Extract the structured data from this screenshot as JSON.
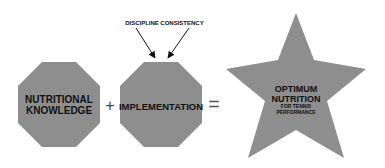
{
  "diagram": {
    "shape_color": "#8e8e8e",
    "text_color": "#111111",
    "left_octagon": {
      "line1": "NUTRITIONAL",
      "line2": "KNOWLEDGE"
    },
    "operator_plus": "+",
    "middle_octagon": {
      "label": "IMPLEMENTATION"
    },
    "arrows": [
      {
        "label": "DISCIPLINE"
      },
      {
        "label": "CONSISTENCY"
      }
    ],
    "operator_equals": "=",
    "star": {
      "line1": "OPTIMUM",
      "line2": "NUTRITION",
      "line3": "FOR TENNIS",
      "line4": "PERFORMANCE"
    }
  }
}
